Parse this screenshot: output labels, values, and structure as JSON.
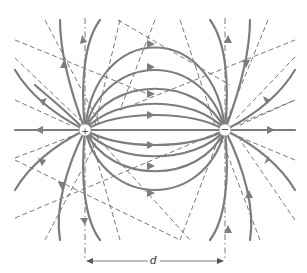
{
  "figure": {
    "charges": [
      {
        "sign": "+",
        "x": 85,
        "y": 130
      },
      {
        "sign": "−",
        "x": 225,
        "y": 130
      }
    ],
    "dimension_label": "d",
    "colors": {
      "field_line": "#7d7d7d",
      "equipotential": "#555555",
      "background": "#ffffff"
    }
  }
}
